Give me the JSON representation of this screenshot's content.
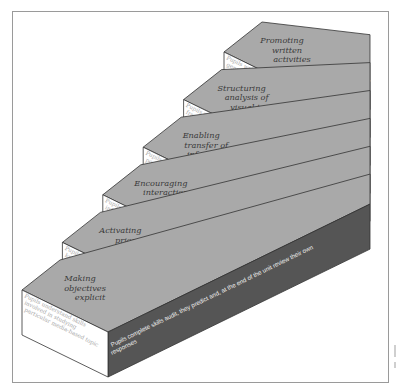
{
  "diagram": {
    "type": "staircase",
    "colors": {
      "top_face": "#a9a9a9",
      "front_face": "#ffffff",
      "side_face": "#555555",
      "outline": "#333333",
      "title_text": "#3a3a3a",
      "front_text": "#a8a8a8",
      "side_text": "#f2f2f2",
      "frame": "#9a9a9a"
    },
    "steps": [
      {
        "title_lines": [
          "Making",
          "objectives",
          "explicit"
        ],
        "front_lines": [
          "Pupils understand skills",
          "involved in studying",
          "particular media-based topic"
        ],
        "side_lines": [
          "Pupils complete skills audit, they predict and, at the end of the unit review their own",
          "responses"
        ]
      },
      {
        "title_lines": [
          "Activating",
          "prior",
          "knowledge"
        ],
        "front_lines": [
          "Pupils offer existing",
          "knowledge in order to be",
          "able to contextualise video"
        ],
        "side_lines": [
          "Group brainstorming/concept mapping activity using shared",
          "recording sheet, pictures and concept mapping prompts."
        ]
      },
      {
        "title_lines": [
          "Encouraging",
          "interaction",
          "with texts"
        ],
        "front_lines": [
          "Pupils skim and scan",
          "information texts and take",
          "notes"
        ],
        "side_lines": [
          "Home and expert groups exercise. Information texts, internet",
          "data and visual support provided + note taking grids."
        ]
      },
      {
        "title_lines": [
          "Enabling",
          "transfer of",
          "information"
        ],
        "front_lines": [
          "Pupils design information",
          "posters for display in the",
          "classroom"
        ],
        "side_lines": [
          "Group activity - individuals contributing to",
          "collaborative design and presentation. Models",
          "of information posters provided."
        ]
      },
      {
        "title_lines": [
          "Structuring",
          "analysis of",
          "visual text"
        ],
        "front_lines": [
          "Pupils analyse a series of",
          "frames from the film track"
        ],
        "side_lines": [
          "Expert groups focus on either",
          "camera viewpoint or sound",
          "track and feedback in pairs"
        ]
      },
      {
        "title_lines": [
          "Promoting",
          "written",
          "activities"
        ],
        "front_lines": [
          "Pupils write in a variety of",
          "genres: diary writing ,",
          "official reports, feature line"
        ],
        "side_lines": [
          "Model provided . Pupils",
          "work in pairs"
        ]
      }
    ]
  }
}
